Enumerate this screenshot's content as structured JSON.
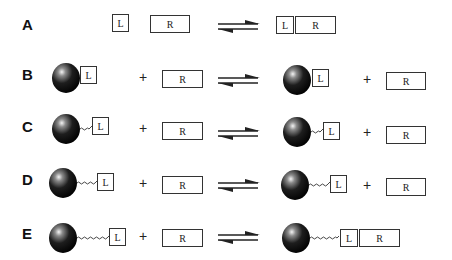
{
  "diagram": {
    "rows": [
      {
        "label": "A",
        "ligand": "L",
        "receptor": "R",
        "plus": "",
        "product_plus": ""
      },
      {
        "label": "B",
        "ligand": "L",
        "receptor": "R",
        "plus": "+",
        "product_ligand": "L",
        "product_plus": "+",
        "product_receptor": "R"
      },
      {
        "label": "C",
        "ligand": "L",
        "receptor": "R",
        "plus": "+",
        "product_ligand": "L",
        "product_plus": "+",
        "product_receptor": "R"
      },
      {
        "label": "D",
        "ligand": "L",
        "receptor": "R",
        "plus": "+",
        "product_ligand": "L",
        "product_plus": "+",
        "product_receptor": "R"
      },
      {
        "label": "E",
        "ligand": "L",
        "receptor": "R",
        "plus": "+",
        "product_ligand": "L",
        "product_receptor": "R"
      }
    ],
    "rowA_product": {
      "ligand": "L",
      "receptor": "R"
    },
    "rowE_product": {
      "ligand": "L",
      "receptor": "R"
    },
    "icons": {
      "equilibrium": "equilibrium-arrow-icon",
      "particle": "sphere-particle-icon",
      "linker": "wavy-linker-icon"
    }
  }
}
